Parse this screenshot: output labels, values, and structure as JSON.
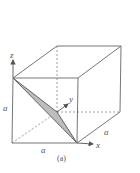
{
  "figure": {
    "caption": "(a)",
    "axes": {
      "x": "x",
      "y": "y",
      "z": "z"
    },
    "edge_labels": {
      "left": "a",
      "bottom": "a",
      "right": "a"
    },
    "colors": {
      "line": "#666666",
      "shade": "#bdbdbd",
      "background": "#ffffff"
    }
  }
}
